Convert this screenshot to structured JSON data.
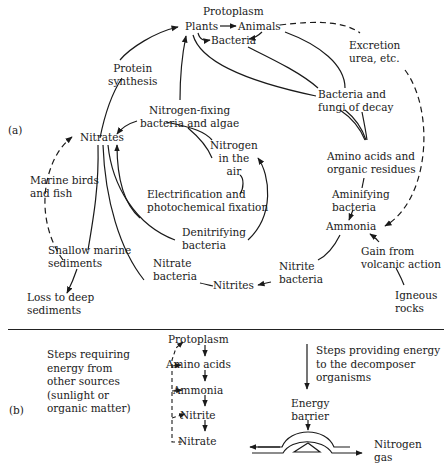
{
  "figure": {
    "panel_a_label": "(a)",
    "panel_b_label": "(b)"
  },
  "panel_a": {
    "nodes": {
      "protoplasm": "Protoplasm",
      "plants": "Plants",
      "animals": "Animals",
      "bacteria": "Bacteria",
      "excretion": "Excretion\nurea, etc.",
      "protein_synthesis": "Protein\nsynthesis",
      "bacteria_fungi_decay": "Bacteria and\nfungi of decay",
      "nitrogen_fixing": "Nitrogen-fixing\nbacteria and algae",
      "nitrates": "Nitrates",
      "nitrogen_air": "Nitrogen\nin the\nair",
      "amino_acids_residues": "Amino acids and\norganic residues",
      "marine_birds_fish": "Marine birds\nand fish",
      "electrification": "Electrification and\nphotochemical fixation",
      "aminifying_bacteria": "Aminifying\nbacteria",
      "denitrifying_bacteria": "Denitrifying\nbacteria",
      "ammonia": "Ammonia",
      "shallow_marine": "Shallow marine\nsediments",
      "gain_volcanic": "Gain from\nvolcanic action",
      "nitrate_bacteria": "Nitrate\nbacteria",
      "nitrite_bacteria": "Nitrite\nbacteria",
      "nitrites": "Nitrites",
      "loss_deep": "Loss to deep\nsediments",
      "igneous_rocks": "Igneous\nrocks"
    }
  },
  "panel_b": {
    "left_caption": "Steps requiring\nenergy from\nother sources\n(sunlight or\norganic matter)",
    "chain": [
      "Protoplasm",
      "Amino acids",
      "Ammonia",
      "Nitrite",
      "Nitrate"
    ],
    "right_caption": "Steps providing energy\nto the decomposer\norganisms",
    "energy_barrier": "Energy\nbarrier",
    "nitrogen_gas": "Nitrogen\ngas"
  }
}
